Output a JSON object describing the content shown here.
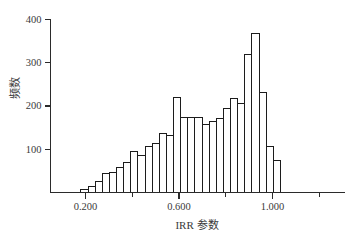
{
  "figure": {
    "background": "#ffffff"
  },
  "chart_data": {
    "type": "bar",
    "subtype": "histogram",
    "title": "",
    "xlabel": "IRR 参数",
    "ylabel": "频数",
    "bin_start": 0.18,
    "bin_width": 0.0305,
    "values": [
      8,
      14,
      25,
      43,
      47,
      58,
      70,
      95,
      86,
      107,
      113,
      137,
      131,
      220,
      174,
      174,
      173,
      157,
      165,
      171,
      195,
      218,
      205,
      318,
      367,
      230,
      106,
      75
    ],
    "xlim": [
      0.05,
      1.31
    ],
    "ylim": [
      0,
      400
    ],
    "x_major_ticks": [
      0.2,
      0.6,
      1.0
    ],
    "x_major_tick_labels": [
      "0.200",
      "0.600",
      "1.000"
    ],
    "x_minor_ticks": [
      0.4,
      0.8,
      1.2
    ],
    "y_ticks": [
      100,
      200,
      300,
      400
    ],
    "y_tick_labels": [
      "100",
      "200",
      "300",
      "400"
    ],
    "grid": false,
    "legend": null,
    "colors": {
      "bar_fill": "#ffffff",
      "bar_stroke": "#1c1c1c",
      "axis": "#2b2b2b",
      "text": "#3a3a3a"
    }
  }
}
